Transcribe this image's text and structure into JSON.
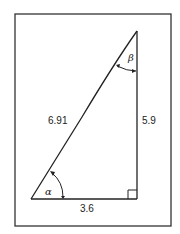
{
  "figure": {
    "type": "right-triangle",
    "hypotenuse_label": "6.91",
    "vertical_side_label": "5.9",
    "horizontal_side_label": "3.6",
    "angle_bottom_left_label": "α",
    "angle_top_label": "β",
    "right_angle_marker": true,
    "colors": {
      "stroke": "#222222",
      "background": "#ffffff"
    }
  }
}
